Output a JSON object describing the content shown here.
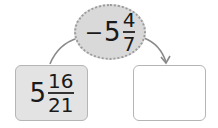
{
  "operation_oval": {
    "sign": "−",
    "whole": "5",
    "numerator": "4",
    "denominator": "7"
  },
  "start_box": {
    "whole": "5",
    "numerator": "16",
    "denominator": "21"
  },
  "result_box": {
    "value": ""
  },
  "colors": {
    "oval_fill": "#d9d9d9",
    "start_fill": "#e3e3e3",
    "result_fill": "#ffffff",
    "stroke": "#8a8a8a"
  }
}
